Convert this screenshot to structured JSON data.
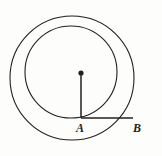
{
  "figure": {
    "type": "geometry-diagram",
    "background_color": "#fdfdfc",
    "stroke_color": "#231f20",
    "canvas": {
      "width": 162,
      "height": 156
    },
    "labels": [
      {
        "id": "A",
        "text": "A",
        "x": 81,
        "y": 118
      },
      {
        "id": "B",
        "text": "B",
        "x": 133,
        "y": 118
      }
    ],
    "shapes": {
      "outer_circle": {
        "name": "outer-circle",
        "cx": 72,
        "cy": 78,
        "r": 62,
        "stroke_width": 1.1
      },
      "inner_circle": {
        "name": "inner-circle",
        "cx": 71,
        "cy": 72,
        "r": 46,
        "stroke_width": 1.1
      },
      "center_dot": {
        "name": "center-dot",
        "cx": 81,
        "cy": 73,
        "r": 2.6
      },
      "radius_segment": {
        "name": "vertical-radius-segment",
        "x1": 81,
        "y1": 73,
        "x2": 81,
        "y2": 118,
        "stroke_width": 1.5
      },
      "horizontal_segment": {
        "name": "horizontal-segment-ab",
        "x1": 81,
        "y1": 118,
        "x2": 133,
        "y2": 118,
        "stroke_width": 1.5
      }
    }
  }
}
